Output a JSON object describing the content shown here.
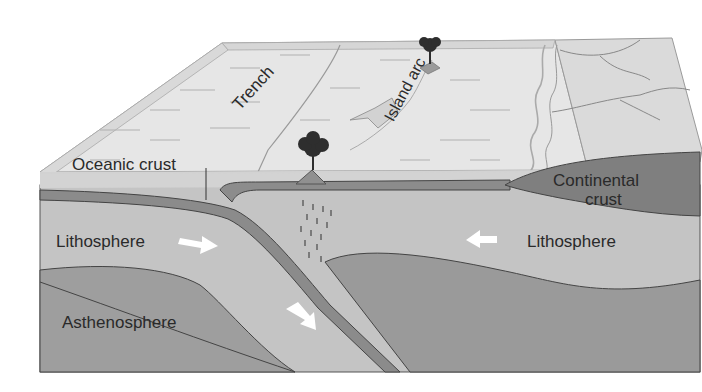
{
  "diagram": {
    "labels": {
      "trench": "Trench",
      "island_arc": "Island arc",
      "oceanic_crust": "Oceanic crust",
      "continental_crust_line1": "Continental",
      "continental_crust_line2": "crust",
      "lithosphere_left": "Lithosphere",
      "lithosphere_right": "Lithosphere",
      "asthenosphere": "Asthenosphere"
    },
    "arrows": [
      {
        "name": "lithosphere-left-arrow",
        "direction": "right"
      },
      {
        "name": "subducting-slab-arrow",
        "direction": "down-right"
      },
      {
        "name": "lithosphere-right-arrow",
        "direction": "left"
      }
    ],
    "colors": {
      "surface": "#e4e4e4",
      "ocean_water": "#cfcfcf",
      "lithosphere": "#c3c3c3",
      "asthenosphere": "#9c9c9c",
      "oceanic_crust": "#8a8a8a",
      "continental_crust": "#7d7d7d",
      "volcano": "#8f8f8f",
      "tree": "#2e2e2e",
      "outline": "#4a4a4a",
      "arrow": "#ffffff"
    }
  }
}
